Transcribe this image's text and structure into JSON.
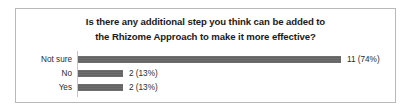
{
  "chart_data": {
    "type": "bar",
    "orientation": "horizontal",
    "title": "Is there any additional step you think can be added to the Rhizome Approach to make it more effective?",
    "title_lines": [
      "Is there any additional step you think can be added to",
      "the Rhizome Approach to make it more effective?"
    ],
    "categories": [
      "Not sure",
      "No",
      "Yes"
    ],
    "values": [
      11,
      2,
      2
    ],
    "percentages": [
      "74%",
      "13%",
      "13%"
    ],
    "data_labels": [
      "11 (74%)",
      "2 (13%)",
      "2 (13%)"
    ],
    "xlabel": "",
    "ylabel": "",
    "xlim": [
      0,
      11
    ],
    "grid": false,
    "legend": false,
    "total_responses": 15,
    "bar_color": "#6b6b6b",
    "axis_color": "#c4c4c4",
    "border_color": "#b9b9b9",
    "text_color": "#2b2b2b",
    "title_color": "#1a1a1a"
  },
  "bars": [
    {
      "category": "Not sure",
      "value": 11,
      "percent": "74%",
      "label": "11 (74%)",
      "width_px": 263
    },
    {
      "category": "No",
      "value": 2,
      "percent": "13%",
      "label": "2 (13%)",
      "width_px": 45
    },
    {
      "category": "Yes",
      "value": 2,
      "percent": "13%",
      "label": "2 (13%)",
      "width_px": 45
    }
  ]
}
